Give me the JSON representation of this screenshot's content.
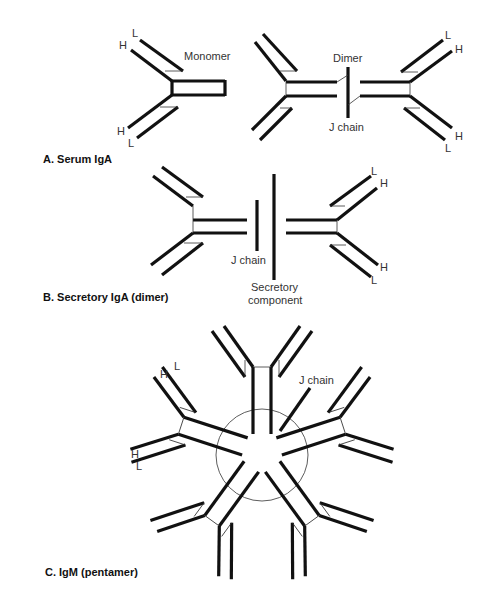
{
  "figure": {
    "panels": [
      {
        "id": "A",
        "title": "A. Serum IgA",
        "labels": {
          "monomer": "Monomer",
          "dimer": "Dimer",
          "j_chain": "J chain",
          "heavy": "H",
          "light": "L"
        }
      },
      {
        "id": "B",
        "title": "B. Secretory IgA (dimer)",
        "labels": {
          "j_chain": "J chain",
          "secretory_line1": "Secretory",
          "secretory_line2": "component",
          "heavy": "H",
          "light": "L"
        }
      },
      {
        "id": "C",
        "title": "C. IgM (pentamer)",
        "labels": {
          "j_chain": "J chain",
          "heavy": "H",
          "light": "L"
        }
      }
    ]
  }
}
